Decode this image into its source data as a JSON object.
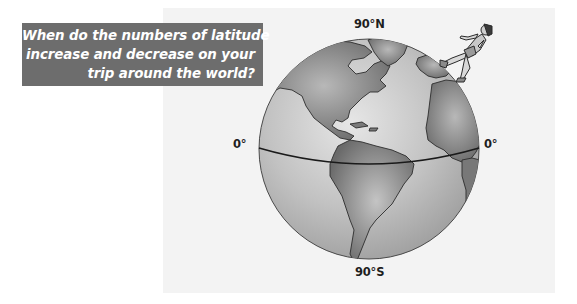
{
  "question": {
    "lines": [
      "When do the numbers of latitude",
      "increase and decrease on your",
      "trip around the world?"
    ]
  },
  "figure": {
    "labels": {
      "north_pole": "90°N",
      "south_pole": "90°S",
      "equator_west": "0°",
      "equator_east": "0°"
    },
    "icons": {
      "globe": "globe-icon",
      "walker": "walking-person-icon",
      "equator": "equator-line"
    }
  },
  "colors": {
    "question_box": "#6d6d6d",
    "question_text": "#ffffff",
    "panel_bg": "#f3f3f3",
    "ocean": "#b9b9b9",
    "land": "#7a7a7a",
    "equator": "#1a1a1a"
  }
}
